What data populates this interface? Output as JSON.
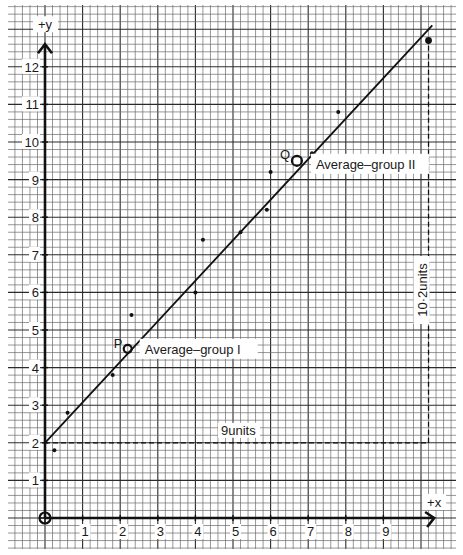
{
  "chart_data": {
    "type": "scatter",
    "title": "",
    "xlabel": "+x",
    "ylabel": "+y",
    "xlim": [
      0,
      10.5
    ],
    "ylim": [
      0,
      13
    ],
    "grid": true,
    "x_ticks": [
      "1",
      "2",
      "3",
      "4",
      "5",
      "6",
      "7",
      "8",
      "9"
    ],
    "y_ticks": [
      "1",
      "2",
      "3",
      "4",
      "5",
      "6",
      "7",
      "8",
      "9",
      "10",
      "11",
      "12"
    ],
    "series": [
      {
        "name": "data points",
        "points": [
          {
            "x": 0.25,
            "y": 1.8
          },
          {
            "x": 0.6,
            "y": 2.8
          },
          {
            "x": 1.8,
            "y": 3.8
          },
          {
            "x": 2.3,
            "y": 5.4
          },
          {
            "x": 4.0,
            "y": 6.0
          },
          {
            "x": 4.2,
            "y": 7.4
          },
          {
            "x": 5.2,
            "y": 7.6
          },
          {
            "x": 5.9,
            "y": 8.2
          },
          {
            "x": 6.0,
            "y": 9.2
          },
          {
            "x": 7.1,
            "y": 9.7
          },
          {
            "x": 7.8,
            "y": 10.8
          },
          {
            "x": 10.2,
            "y": 12.7
          }
        ]
      },
      {
        "name": "averages",
        "points": [
          {
            "label": "P",
            "x": 2.2,
            "y": 4.5,
            "annotation": "Average–group I"
          },
          {
            "label": "Q",
            "x": 6.7,
            "y": 9.5,
            "annotation": "Average–group II"
          }
        ]
      }
    ],
    "fit_line": {
      "x0": 0,
      "y0": 2.0,
      "x1": 10.3,
      "y1": 13.1,
      "slope": 1.08,
      "intercept": 2.0
    },
    "annotations": [
      {
        "text": "9units",
        "type": "horizontal-dashed",
        "from": [
          0,
          2
        ],
        "to": [
          10.2,
          2
        ]
      },
      {
        "text": "10.2units",
        "type": "vertical-dashed",
        "from": [
          10.2,
          2
        ],
        "to": [
          10.2,
          12.7
        ]
      }
    ],
    "origin_marker": "⊕"
  },
  "labels": {
    "y_axis": "+y",
    "x_axis": "+x",
    "p": "P",
    "q": "Q",
    "avg1": "Average–group I",
    "avg2": "Average–group II",
    "horiz_units": "9units",
    "vert_units": "10·2units"
  },
  "ticks": {
    "x": [
      "1",
      "2",
      "3",
      "4",
      "5",
      "6",
      "7",
      "8",
      "9"
    ],
    "y": [
      "1",
      "2",
      "3",
      "4",
      "5",
      "6",
      "7",
      "8",
      "9",
      "10",
      "11",
      "12"
    ]
  }
}
